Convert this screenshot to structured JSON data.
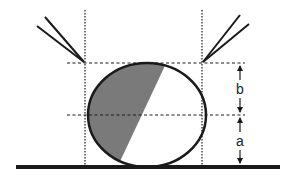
{
  "diagram": {
    "labels": {
      "upper_dimension": "b",
      "lower_dimension": "a"
    },
    "colors": {
      "line": "#1a1a1a",
      "shade": "#7a7a7a",
      "background": "#ffffff"
    },
    "ellipse": {
      "cx": 147,
      "cy": 115,
      "rx": 59,
      "ry": 52
    },
    "guides": {
      "left_x": 85,
      "right_x": 202,
      "top_y": 63,
      "middle_y": 115,
      "baseline_y": 166
    }
  }
}
